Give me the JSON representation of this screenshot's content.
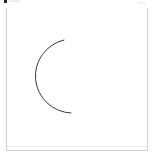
{
  "window": {
    "title": "Canvas",
    "status": "100%"
  },
  "canvas": {
    "background": "#ffffff",
    "border_color": "#cfcfcf",
    "shapes": [
      {
        "type": "arc",
        "stroke": "#3a3a3a",
        "stroke_width": 1,
        "center": [
          78,
          77
        ],
        "radius": 37,
        "start_point": [
          64,
          40
        ],
        "end_point": [
          71,
          113
        ],
        "path": "M 64 40 A 37 37 0 0 0 71 113"
      }
    ]
  }
}
